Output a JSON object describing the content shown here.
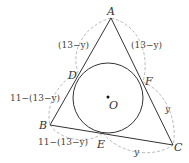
{
  "diagram": {
    "type": "geometry-incircle",
    "points": {
      "A": {
        "label": "A",
        "x": 111,
        "y": 18
      },
      "B": {
        "label": "B",
        "x": 50,
        "y": 125
      },
      "C": {
        "label": "C",
        "x": 173,
        "y": 145
      },
      "D": {
        "label": "D",
        "x": 78,
        "y": 72
      },
      "E": {
        "label": "E",
        "x": 103,
        "y": 133
      },
      "F": {
        "label": "F",
        "x": 143,
        "y": 82
      },
      "O": {
        "label": "O",
        "x": 108,
        "y": 98
      }
    },
    "incircle": {
      "cx": 108,
      "cy": 98,
      "r": 35
    },
    "segment_labels": {
      "AD": "(13−y)",
      "AF": "(13−y)",
      "BD": "11−(13−y)",
      "BE": "11−(13−y)",
      "FC": "y",
      "EC": "y"
    },
    "colors": {
      "triangle": "#333333",
      "circle": "#333333",
      "arcs": "#aaaaaa",
      "text": "#333333"
    }
  }
}
